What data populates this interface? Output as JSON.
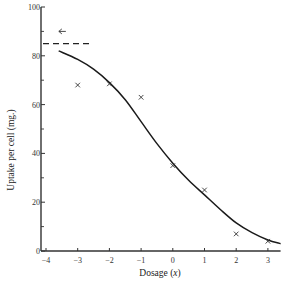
{
  "chart_data": {
    "type": "scatter",
    "title": "",
    "xlabel": "Dosage (x)",
    "xlabel_main": "Dosage",
    "xlabel_var": "x",
    "ylabel": "Uptake per cell (mg.)",
    "xlim": [
      -4,
      3.4
    ],
    "ylim": [
      0,
      100
    ],
    "x_ticks": [
      -4,
      -3,
      -2,
      -1,
      0,
      1,
      2,
      3
    ],
    "x_tick_labels": [
      "−4",
      "−3",
      "−2",
      "−1",
      "0",
      "1",
      "2",
      "3"
    ],
    "y_ticks": [
      0,
      20,
      40,
      60,
      80,
      100
    ],
    "y_tick_labels": [
      "0",
      "20",
      "40",
      "60",
      "80",
      "100"
    ],
    "y_minor_ticks": [
      10,
      30,
      50,
      70,
      90
    ],
    "grid": false,
    "series": [
      {
        "name": "observed",
        "marker": "x",
        "x": [
          -3,
          -2,
          -1,
          0,
          1,
          2,
          3
        ],
        "y": [
          68,
          68.5,
          63,
          35,
          25,
          7,
          4
        ]
      },
      {
        "name": "fitted curve",
        "style": "solid line",
        "x": [
          -3.6,
          -3,
          -2.5,
          -2,
          -1.5,
          -1,
          -0.5,
          0,
          0.5,
          1,
          1.5,
          2,
          2.5,
          3,
          3.4
        ],
        "y": [
          82,
          78.5,
          74.5,
          69,
          62,
          53,
          44,
          36,
          29,
          23,
          17,
          11.5,
          7.5,
          4.5,
          3
        ]
      }
    ],
    "annotations": [
      {
        "type": "dashed horizontal line",
        "y": 85,
        "x_from": -4,
        "x_to": -2.6,
        "label": "asymptote"
      },
      {
        "type": "arrow",
        "direction": "left",
        "x": -3.5,
        "y": 90
      }
    ]
  }
}
